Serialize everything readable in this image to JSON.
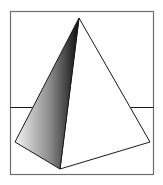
{
  "figure": {
    "colors": {
      "background": "#ffffff",
      "frame": "#6e6e6e",
      "edge": "#1a1a1a",
      "shade_light": "#f2f2f2",
      "shade_dark": "#111111"
    }
  }
}
